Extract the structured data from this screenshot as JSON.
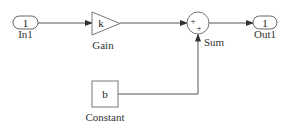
{
  "diagram": {
    "type": "simulink-block-diagram",
    "blocks": {
      "in1": {
        "content": "1",
        "label": "In1",
        "kind": "inport"
      },
      "gain": {
        "content": "k",
        "label": "Gain",
        "kind": "gain"
      },
      "sum": {
        "signs": [
          "+",
          "+"
        ],
        "label": "Sum",
        "kind": "sum"
      },
      "out1": {
        "content": "1",
        "label": "Out1",
        "kind": "outport"
      },
      "constant": {
        "content": "b",
        "label": "Constant",
        "kind": "constant"
      }
    },
    "connections": [
      {
        "from": "In1",
        "to": "Gain"
      },
      {
        "from": "Gain",
        "to": "Sum"
      },
      {
        "from": "Sum",
        "to": "Out1"
      },
      {
        "from": "Constant",
        "to": "Sum"
      }
    ],
    "colors": {
      "line": "#555555",
      "block_border": "#777777",
      "background": "#ffffff"
    }
  }
}
